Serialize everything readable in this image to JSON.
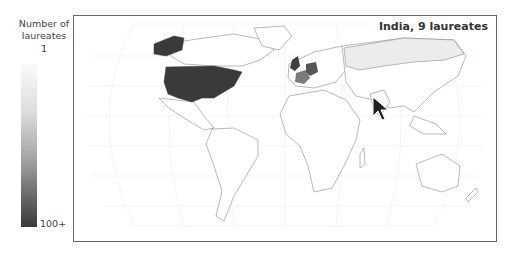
{
  "legend": {
    "title_line1": "Number of",
    "title_line2": "laureates",
    "min_label": "1",
    "max_label": "100+",
    "color_min": "#fafafa",
    "color_max": "#3a3a3a"
  },
  "map": {
    "projection": "Robinson",
    "hover_label": "India, 9 laureates",
    "highlighted_countries": [
      {
        "name": "United States",
        "shade": "#3a3a3a"
      },
      {
        "name": "United Kingdom",
        "shade": "#404040"
      },
      {
        "name": "Germany",
        "shade": "#555555"
      },
      {
        "name": "France",
        "shade": "#7a7a7a"
      },
      {
        "name": "Russia",
        "shade": "#ececec"
      },
      {
        "name": "India",
        "shade": "#fafafa"
      }
    ]
  },
  "cursor": {
    "icon": "arrow-cursor-icon"
  }
}
